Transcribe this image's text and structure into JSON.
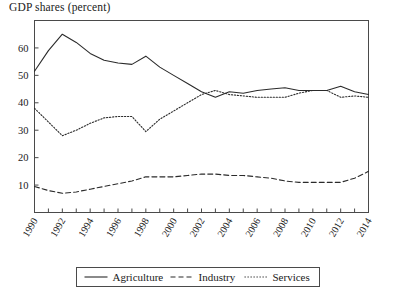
{
  "chart_data": {
    "type": "line",
    "title": "GDP shares (percent)",
    "xlabel": "",
    "ylabel": "",
    "xlim": [
      1990,
      2014
    ],
    "ylim": [
      0,
      70
    ],
    "grid": false,
    "legend_position": "bottom",
    "y_ticks": [
      10,
      20,
      30,
      40,
      50,
      60
    ],
    "y_tick_labels": [
      "10",
      "20",
      "30",
      "40",
      "50",
      "60"
    ],
    "x": [
      1990,
      1991,
      1992,
      1993,
      1994,
      1995,
      1996,
      1997,
      1998,
      1999,
      2000,
      2001,
      2002,
      2003,
      2004,
      2005,
      2006,
      2007,
      2008,
      2009,
      2010,
      2011,
      2012,
      2013,
      2014
    ],
    "x_tick_labels": [
      "1990",
      "1991",
      "1992",
      "1993",
      "1994",
      "1995",
      "1996",
      "1997",
      "1998",
      "1999",
      "2000",
      "2001",
      "2002",
      "2003",
      "2004",
      "2005",
      "2006",
      "2007",
      "2008",
      "2009",
      "2010",
      "2011",
      "2012",
      "2013",
      "2014"
    ],
    "x_tick_labels_shown": [
      "1990",
      "1992",
      "1994",
      "1996",
      "1998",
      "2000",
      "2002",
      "2004",
      "2006",
      "2008",
      "2010",
      "2012",
      "2014"
    ],
    "series": [
      {
        "name": "Agriculture",
        "style": "solid",
        "color": "#2b2b2b",
        "values": [
          51.5,
          59.0,
          65.0,
          62.0,
          58.0,
          55.5,
          54.5,
          54.0,
          57.0,
          53.0,
          50.0,
          47.0,
          44.0,
          42.0,
          44.0,
          43.5,
          44.5,
          45.0,
          45.5,
          44.5,
          44.5,
          44.5,
          46.0,
          44.0,
          43.0
        ]
      },
      {
        "name": "Industry",
        "style": "dashed",
        "color": "#2b2b2b",
        "values": [
          9.5,
          8.0,
          7.0,
          7.5,
          8.5,
          9.5,
          10.5,
          11.5,
          13.0,
          13.0,
          13.0,
          13.5,
          14.0,
          14.0,
          13.5,
          13.5,
          13.0,
          12.5,
          11.5,
          11.0,
          11.0,
          11.0,
          11.0,
          12.5,
          15.0
        ]
      },
      {
        "name": "Services",
        "style": "dotted",
        "color": "#2b2b2b",
        "values": [
          38.0,
          33.0,
          28.0,
          30.0,
          32.5,
          34.5,
          35.0,
          35.0,
          29.5,
          34.0,
          37.0,
          40.0,
          43.0,
          44.5,
          43.0,
          42.5,
          42.0,
          42.0,
          42.0,
          43.5,
          44.5,
          44.5,
          42.0,
          42.5,
          42.0
        ]
      }
    ],
    "legend": [
      {
        "label": "Agriculture",
        "style": "solid"
      },
      {
        "label": "Industry",
        "style": "dashed"
      },
      {
        "label": "Services",
        "style": "dotted"
      }
    ]
  }
}
